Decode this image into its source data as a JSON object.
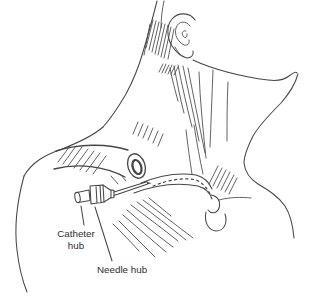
{
  "illustration": {
    "labels": {
      "catheter_hub_line1": "Catheter",
      "catheter_hub_line2": "hub",
      "needle_hub": "Needle hub"
    },
    "colors": {
      "line": "#474747",
      "text": "#2e2e2e",
      "background": "#ffffff"
    }
  }
}
